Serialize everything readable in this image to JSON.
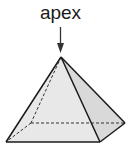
{
  "diagram": {
    "label": "apex",
    "shape": "square pyramid",
    "colors": {
      "stroke": "#1a1a1a",
      "face_left": "#e6e6e6",
      "face_right": "#d8d8d8",
      "background": "#ffffff"
    },
    "vertices": {
      "apex": [
        61,
        57
      ],
      "front_left": [
        6,
        142
      ],
      "front_right": [
        100,
        142
      ],
      "back_right": [
        125,
        123
      ],
      "back_left": [
        31,
        123
      ]
    },
    "hidden_edges": [
      "apex-back_left",
      "back_left-front_left",
      "back_left-back_right"
    ]
  }
}
